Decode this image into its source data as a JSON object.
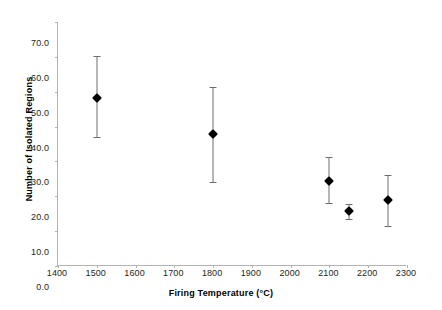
{
  "chart_data": {
    "type": "scatter",
    "title": "",
    "xlabel": "Firing Temperature (°C)",
    "ylabel": "Number of Isolated Regions",
    "xlim": [
      1400,
      2300
    ],
    "ylim": [
      0.0,
      70.0
    ],
    "xticks": [
      1400,
      1500,
      1600,
      1700,
      1800,
      1900,
      2000,
      2100,
      2200,
      2300
    ],
    "xtick_labels": [
      "1400",
      "1500",
      "1600",
      "1700",
      "1800",
      "1900",
      "2000",
      "2100",
      "2200",
      "2300"
    ],
    "yticks": [
      0.0,
      10.0,
      20.0,
      30.0,
      40.0,
      50.0,
      60.0,
      70.0
    ],
    "ytick_labels": [
      "0.0",
      "10.0",
      "20.0",
      "30.0",
      "40.0",
      "50.0",
      "60.0",
      "70.0"
    ],
    "grid": false,
    "legend": "none",
    "marker": "diamond",
    "marker_color": "#000000",
    "errorbar_color": "#6e6e6e",
    "axis_color": "#b3b3b3",
    "x": [
      1500,
      1800,
      2100,
      2150,
      2250
    ],
    "y": [
      48.2,
      37.8,
      24.3,
      15.7,
      18.9
    ],
    "yerr_upper": [
      60.3,
      51.4,
      31.2,
      17.7,
      26.1
    ],
    "yerr_lower": [
      37.0,
      24.2,
      18.0,
      13.4,
      11.5
    ],
    "points": [
      {
        "x": 1500,
        "y": 48.2,
        "hi": 60.3,
        "lo": 37.0
      },
      {
        "x": 1800,
        "y": 37.8,
        "hi": 51.4,
        "lo": 24.2
      },
      {
        "x": 2100,
        "y": 24.3,
        "hi": 31.2,
        "lo": 18.0
      },
      {
        "x": 2150,
        "y": 15.7,
        "hi": 17.7,
        "lo": 13.4
      },
      {
        "x": 2250,
        "y": 18.9,
        "hi": 26.1,
        "lo": 11.5
      }
    ]
  }
}
